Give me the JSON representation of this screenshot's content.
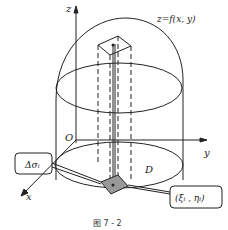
{
  "figure": {
    "caption": "图 7 - 2",
    "surface_label": "z=f(x, y)",
    "axes": {
      "x": "x",
      "y": "y",
      "z": "z",
      "origin": "O"
    },
    "region_label": "D",
    "area_element_label": "Δσᵢ",
    "point_label": "(ξᵢ , ηᵢ)"
  }
}
